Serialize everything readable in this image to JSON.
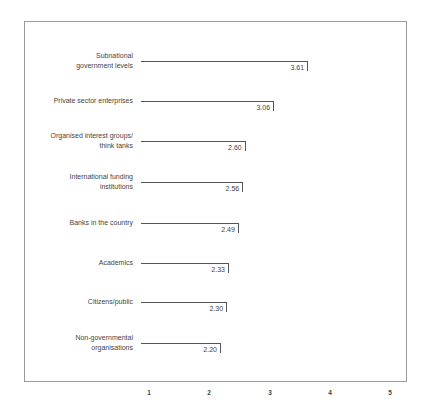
{
  "chart_data": {
    "type": "bar",
    "orientation": "horizontal",
    "title": "",
    "xlabel": "",
    "ylabel": "",
    "categories": [
      "Subnational government levels",
      "Private sector enterprises",
      "Organised interest groups/ think tanks",
      "International funding institutions",
      "Banks in the country",
      "Academics",
      "Citizens/public",
      "Non-governmental organisations"
    ],
    "values": [
      3.61,
      3.06,
      2.6,
      2.56,
      2.49,
      2.33,
      2.3,
      2.2
    ],
    "value_labels": [
      "3.61",
      "3.06",
      "2.60",
      "2.56",
      "2.49",
      "2.33",
      "2.30",
      "2.20"
    ],
    "xlim": [
      0,
      5
    ],
    "x_ticks": [
      "1",
      "2",
      "3",
      "4",
      "5"
    ],
    "grid": false,
    "legend": null
  },
  "rows": [
    {
      "label_lines": [
        "Subnational",
        "government levels"
      ],
      "value": "3.61"
    },
    {
      "label_lines": [
        "Private sector enterprises"
      ],
      "value": "3.06"
    },
    {
      "label_lines": [
        "Organised interest groups/",
        "think tanks"
      ],
      "value": "2.60"
    },
    {
      "label_lines": [
        "International funding",
        "institutions"
      ],
      "value": "2.56"
    },
    {
      "label_lines": [
        "Banks in the country"
      ],
      "value": "2.49"
    },
    {
      "label_lines": [
        "Academics"
      ],
      "value": "2.33"
    },
    {
      "label_lines": [
        "Citizens/public"
      ],
      "value": "2.30"
    },
    {
      "label_lines": [
        "Non-governmental",
        "organisations"
      ],
      "value": "2.20"
    }
  ],
  "axis": {
    "ticks": [
      "1",
      "2",
      "3",
      "4",
      "5"
    ]
  },
  "colors": {
    "bar_line": "#555555",
    "frame": "#9a9a9a",
    "text": "#444444"
  }
}
